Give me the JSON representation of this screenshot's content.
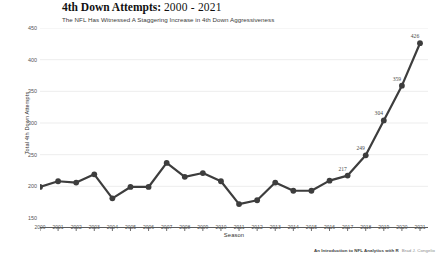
{
  "header": {
    "title_main": "4th Down Attempts:",
    "title_range": "2000 - 2021",
    "subtitle": "The NFL Has Witnessed A Staggering Increase in 4th Down Aggressiveness"
  },
  "caption": {
    "source": "An Introduction to NFL Analytics with R",
    "author": "Brad J. Congelio"
  },
  "style": {
    "line_color": "#3d3d3d",
    "point_color": "#3d3d3d",
    "grid_color": "#e8e8e8",
    "axis_color": "#4a4a4a",
    "background": "#ffffff"
  },
  "chart_data": {
    "type": "line",
    "title": "4th Down Attempts: 2000 - 2021",
    "subtitle": "The NFL Has Witnessed A Staggering Increase in 4th Down Aggressiveness",
    "xlabel": "Season",
    "ylabel": "Total 4th Down Attempts",
    "x": [
      2000,
      2001,
      2002,
      2003,
      2004,
      2005,
      2006,
      2007,
      2008,
      2009,
      2010,
      2011,
      2012,
      2013,
      2014,
      2015,
      2016,
      2017,
      2018,
      2019,
      2020,
      2021
    ],
    "values": [
      199,
      208,
      206,
      219,
      181,
      199,
      199,
      237,
      215,
      221,
      208,
      172,
      178,
      206,
      193,
      193,
      209,
      217,
      249,
      304,
      359,
      426
    ],
    "point_labels": [
      null,
      null,
      null,
      null,
      null,
      null,
      null,
      null,
      null,
      null,
      null,
      null,
      null,
      null,
      null,
      null,
      null,
      "217",
      "249",
      "304",
      "359",
      "426"
    ],
    "xlim": [
      2000,
      2021
    ],
    "ylim": [
      150,
      450
    ],
    "yticks": [
      150,
      200,
      250,
      300,
      350,
      400,
      450
    ],
    "ytick_labels": [
      "150",
      "200",
      "250",
      "300",
      "350",
      "400",
      "450"
    ],
    "xtick_labels": [
      "2000",
      "2001",
      "2002",
      "2003",
      "2004",
      "2005",
      "2006",
      "2007",
      "2008",
      "2009",
      "2010",
      "2011",
      "2012",
      "2013",
      "2014",
      "2015",
      "2016",
      "2017",
      "2018",
      "2019",
      "2020",
      "2021"
    ],
    "grid": "horizontal",
    "legend": "none",
    "marker": "circle",
    "linestyle": "solid"
  }
}
